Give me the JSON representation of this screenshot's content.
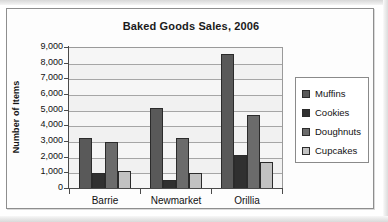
{
  "chart_data": {
    "type": "bar",
    "title": "Baked Goods Sales, 2006",
    "xlabel": "",
    "ylabel": "Number of Items",
    "categories": [
      "Barrie",
      "Newmarket",
      "Orillia"
    ],
    "series": [
      {
        "name": "Muffins",
        "color": "#595959",
        "values": [
          3250,
          5200,
          8600
        ]
      },
      {
        "name": "Cookies",
        "color": "#303030",
        "values": [
          1050,
          600,
          2200
        ]
      },
      {
        "name": "Doughnuts",
        "color": "#6b6b6b",
        "values": [
          3000,
          3250,
          4700
        ]
      },
      {
        "name": "Cupcakes",
        "color": "#c2c2c2",
        "values": [
          1150,
          1050,
          1750
        ]
      }
    ],
    "ylim": [
      0,
      9000
    ],
    "ytick_step": 1000,
    "ytick_labels": [
      "9,000",
      "8,000",
      "7,000",
      "6,000",
      "5,000",
      "4,000",
      "3,000",
      "2,000",
      "1,000",
      "0"
    ],
    "grid": true,
    "legend_position": "right"
  },
  "legend": {
    "items": [
      {
        "label": "Muffins"
      },
      {
        "label": "Cookies"
      },
      {
        "label": "Doughnuts"
      },
      {
        "label": "Cupcakes"
      }
    ]
  }
}
